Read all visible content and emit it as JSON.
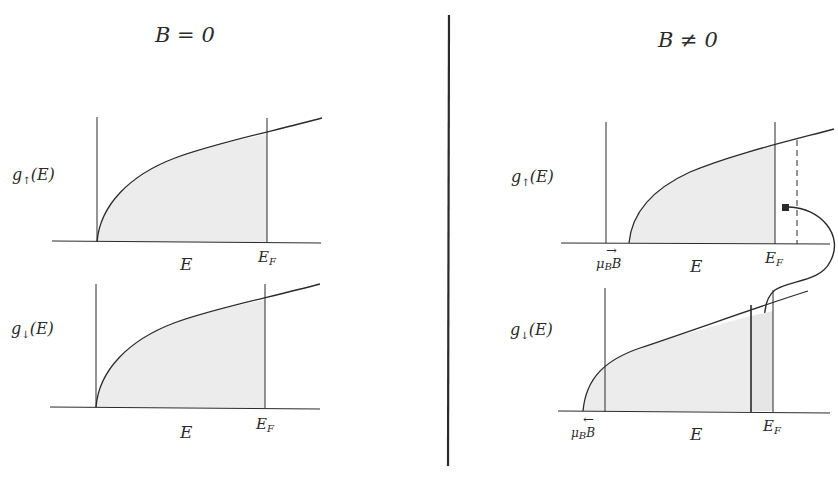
{
  "left_panel": {
    "title": "B = 0",
    "upper": {
      "ylabel_g": "g",
      "ylabel_sub": "↑",
      "ylabel_rest": "(E)",
      "xlabel": "E",
      "fermi_main": "E",
      "fermi_sub": "F"
    },
    "lower": {
      "ylabel_g": "g",
      "ylabel_sub": "↓",
      "ylabel_rest": "(E)",
      "xlabel": "E",
      "fermi_main": "E",
      "fermi_sub": "F"
    }
  },
  "right_panel": {
    "title": "B ≠ 0",
    "upper": {
      "ylabel_g": "g",
      "ylabel_sub": "↑",
      "ylabel_rest": "(E)",
      "xlabel": "E",
      "fermi_main": "E",
      "fermi_sub": "F",
      "shift_mu": "μ",
      "shift_sub": "B",
      "shift_B": "B",
      "shift_arrow": "→"
    },
    "lower": {
      "ylabel_g": "g",
      "ylabel_sub": "↓",
      "ylabel_rest": "(E)",
      "xlabel": "E",
      "fermi_main": "E",
      "fermi_sub": "F",
      "shift_mu": "μ",
      "shift_sub": "B",
      "shift_B": "B",
      "shift_arrow": "←"
    }
  },
  "colors": {
    "ink": "#2a2a2a",
    "fill": "#ececec",
    "background": "#ffffff"
  }
}
